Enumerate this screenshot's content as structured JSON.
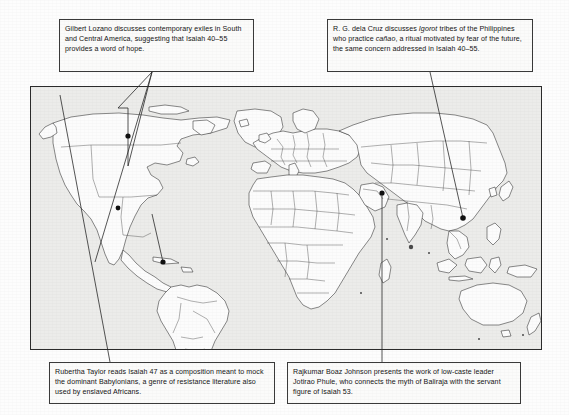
{
  "figure": {
    "type": "annotated-world-map",
    "map_region_label": "world-map"
  },
  "callouts": [
    {
      "id": "top-left",
      "text": "Gilbert Lozano discusses contemporary exiles in South and Central America, suggesting that Isaiah 40–55 provides a word of hope.",
      "line_1": "Gilbert Lozano discusses contemporary",
      "line_2": "exiles in South and Central America,",
      "line_3": "suggesting that Isaiah 40–55 provides a",
      "line_4": "word of hope.",
      "points_to": [
        "North America",
        "Central America",
        "South America"
      ]
    },
    {
      "id": "top-right",
      "text_part_1": "R. G. dela Cruz discusses ",
      "italic_1": "Igorot",
      "text_part_2": " tribes of the Philippines who practice ",
      "italic_2": "cañao",
      "text_part_3": ", a ritual motivated by fear of the future, the same concern addressed in Isaiah 40–55.",
      "points_to": [
        "Philippines"
      ]
    },
    {
      "id": "bottom-left",
      "text": "Rubertha Taylor reads Isaiah 47 as a composition meant to mock the dominant Babylonians, a genre of resistance literature also used by enslaved Africans.",
      "line_1": "Rubertha Taylor reads Isaiah 47 as a composition meant",
      "line_2": "to mock the dominant Babylonians, a genre of resistance",
      "line_3": "literature also used by enslaved Africans.",
      "points_to": [
        "Mesopotamia / West Asia"
      ]
    },
    {
      "id": "bottom-right",
      "text": "Rajkumar Boaz Johnson presents the work of low-caste leader Jotirao Phule, who connects the myth of Baliraja with the servant figure of Isaiah 53.",
      "line_1": "Rajkumar Boaz Johnson presents the work of low-caste",
      "line_2": "leader Jotirao Phule, who connects the myth of Baliraja",
      "line_3": "with the servant figure of Isaiah 53.",
      "points_to": [
        "India"
      ]
    }
  ],
  "markers": [
    {
      "name": "north-america-marker",
      "x": 98,
      "y": 155
    },
    {
      "name": "central-america-merica-marker",
      "x": 92,
      "y": 205
    },
    {
      "name": "south-america-marker",
      "x": 163,
      "y": 262
    },
    {
      "name": "philippines-marker",
      "x": 463,
      "y": 218
    },
    {
      "name": "india-marker",
      "x": 382,
      "y": 193
    }
  ],
  "colors": {
    "frame": "#2b2b2b",
    "map_background": "#ececea",
    "land_fill": "#fcfcfc",
    "land_stroke": "#2a2a2a",
    "callout_border": "#3a3a3a",
    "text": "#151515"
  }
}
